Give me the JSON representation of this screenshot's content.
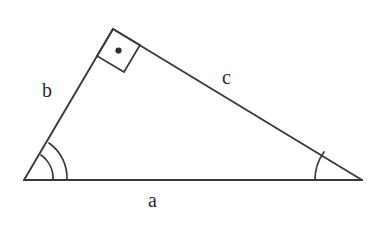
{
  "diagram": {
    "kind": "right-triangle-geometry",
    "background_color": "#ffffff",
    "stroke_color": "#3a3a3a",
    "label_color": "#2b2b2b",
    "vertices": {
      "left": {
        "name": "A",
        "x": 24,
        "y": 180
      },
      "apex": {
        "name": "B",
        "x": 113,
        "y": 29
      },
      "right": {
        "name": "C",
        "x": 362,
        "y": 180
      }
    },
    "sides": {
      "base": {
        "label": "a",
        "from": "A",
        "to": "C",
        "path": "M 24 180 L 362 180"
      },
      "left_leg": {
        "label": "b",
        "from": "A",
        "to": "B",
        "path": "M 24 180 L 113 29"
      },
      "hypotenuse_upper": {
        "label": "c",
        "from": "B",
        "to": "C",
        "path": "M 113 29 L 362 180"
      }
    },
    "angle_marks": {
      "left_vertex": {
        "type": "double-arc",
        "arc_inner": "M 53 180 A 29 29 0 0 0 41 155",
        "arc_outer": "M 67 180 A 43 43 0 0 0 49 143"
      },
      "right_vertex": {
        "type": "single-arc",
        "arc": "M 315 180 A 47 47 0 0 1 324 152"
      },
      "apex_right_angle": {
        "type": "square-with-dot",
        "square_points": "113,29 140,45 124,72 97,56",
        "dot_center_x": 118.5,
        "dot_center_y": 50.5,
        "dot_radius": 3.1
      }
    },
    "labels": {
      "a": "a",
      "b": "b",
      "c": "c"
    }
  }
}
